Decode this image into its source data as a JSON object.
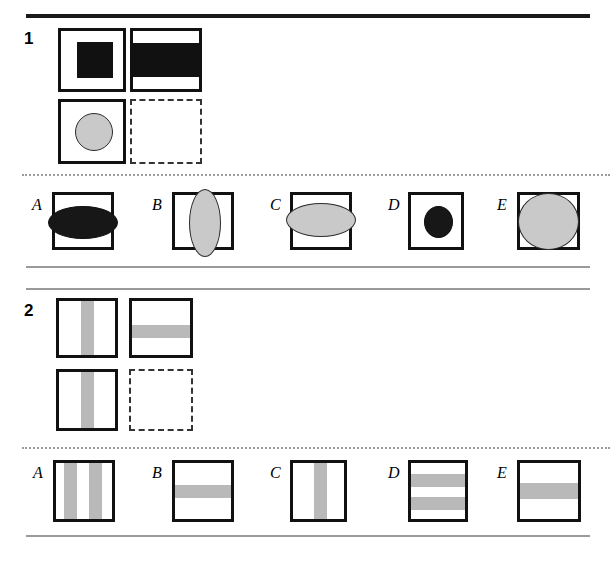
{
  "page": {
    "background": "#ffffff",
    "width": 616,
    "height": 568,
    "colors": {
      "ink": "#111111",
      "gray_fill": "#c9c9c9",
      "gray_stripe": "#b9b9b9",
      "rule_gray": "#9a9a9a",
      "dotted_gray": "#9d9d9d",
      "black_fill": "#171717"
    }
  },
  "rules": {
    "top_rule": "",
    "mid_rule_upper": "",
    "mid_rule_lower": "",
    "bottom_rule": "",
    "dotted_separator_1": "",
    "dotted_separator_2": ""
  },
  "puzzles": [
    {
      "number": "1",
      "stimulus": {
        "a": {
          "name": "black-square-in-box",
          "description": "centered filled black square"
        },
        "b": {
          "name": "black-horizontal-band-box",
          "description": "wide black horizontal band spanning full width"
        },
        "c": {
          "name": "gray-circle-in-box",
          "description": "centered gray circle with dark outline"
        },
        "d": {
          "name": "missing-answer-box",
          "description": "empty dashed box (answer goes here)"
        }
      },
      "options": [
        {
          "label": "A",
          "name": "option-a",
          "description": "wide flat black ellipse overflowing box sides"
        },
        {
          "label": "B",
          "name": "option-b",
          "description": "tall narrow gray ellipse overflowing box top and bottom"
        },
        {
          "label": "C",
          "name": "option-c",
          "description": "wide gray ellipse overflowing box sides"
        },
        {
          "label": "D",
          "name": "option-d",
          "description": "small black circle centered in box"
        },
        {
          "label": "E",
          "name": "option-e",
          "description": "large gray circle filling the box"
        }
      ]
    },
    {
      "number": "2",
      "stimulus": {
        "a": {
          "name": "vertical-gray-stripe-box",
          "description": "single vertical gray stripe centered"
        },
        "b": {
          "name": "horizontal-gray-stripe-box",
          "description": "single horizontal gray stripe"
        },
        "c": {
          "name": "vertical-gray-stripe-box-2",
          "description": "single vertical gray stripe centered"
        },
        "d": {
          "name": "missing-answer-box",
          "description": "empty dashed box (answer goes here)"
        }
      },
      "options": [
        {
          "label": "A",
          "name": "option-a",
          "description": "two vertical gray stripes"
        },
        {
          "label": "B",
          "name": "option-b",
          "description": "one horizontal gray stripe, upper middle"
        },
        {
          "label": "C",
          "name": "option-c",
          "description": "one vertical gray stripe, centered"
        },
        {
          "label": "D",
          "name": "option-d",
          "description": "two horizontal gray stripes"
        },
        {
          "label": "E",
          "name": "option-e",
          "description": "one thick horizontal gray stripe, centered"
        }
      ]
    }
  ]
}
